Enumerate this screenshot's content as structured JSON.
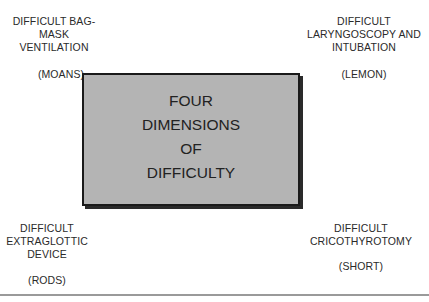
{
  "diagram": {
    "center": {
      "lines": [
        "FOUR",
        "DIMENSIONS",
        "OF",
        "DIFFICULTY"
      ],
      "fill_color": "#b4b4b4",
      "border_color": "#1a1a1a"
    },
    "quadrants": {
      "top_left": {
        "lines": [
          "DIFFICULT BAG-",
          "MASK",
          "VENTILATION"
        ],
        "mnemonic": "(MOANS)"
      },
      "top_right": {
        "lines": [
          "DIFFICULT",
          "LARYNGOSCOPY AND",
          "INTUBATION"
        ],
        "mnemonic": "(LEMON)"
      },
      "bottom_left": {
        "lines": [
          "DIFFICULT",
          "EXTRAGLOTTIC",
          "DEVICE"
        ],
        "mnemonic": "(RODS)"
      },
      "bottom_right": {
        "lines": [
          "DIFFICULT",
          "CRICOTHYROTOMY"
        ],
        "mnemonic": "(SHORT)"
      }
    }
  }
}
